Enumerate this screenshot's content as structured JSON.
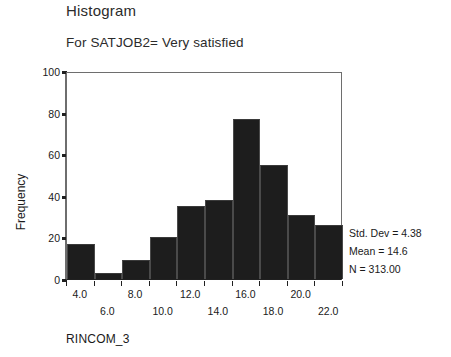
{
  "chart_data": {
    "type": "bar",
    "title": "Histogram",
    "subtitle": "For SATJOB2= Very satisfied",
    "xlabel": "RINCOM_3",
    "ylabel": "Frequency",
    "ylim": [
      0,
      100
    ],
    "xlim": [
      3,
      23
    ],
    "grid": false,
    "legend": null,
    "bin_width": 2,
    "bin_starts": [
      3,
      5,
      7,
      9,
      11,
      13,
      15,
      17,
      19,
      21
    ],
    "bin_centers": [
      4,
      6,
      8,
      10,
      12,
      14,
      16,
      18,
      20,
      22
    ],
    "categories": [
      "4.0",
      "6.0",
      "8.0",
      "10.0",
      "12.0",
      "14.0",
      "16.0",
      "18.0",
      "20.0",
      "22.0"
    ],
    "values": [
      17,
      3,
      9,
      20,
      35,
      38,
      77,
      55,
      31,
      26
    ],
    "y_ticks": [
      0,
      20,
      40,
      60,
      80,
      100
    ],
    "y_tick_labels": [
      "0",
      "20",
      "40",
      "60",
      "80",
      "100"
    ],
    "x_ticks": [
      3,
      5,
      7,
      9,
      11,
      13,
      15,
      17,
      19,
      21,
      23
    ],
    "x_tick_labels_top": [
      "4.0",
      "8.0",
      "12.0",
      "16.0",
      "20.0"
    ],
    "x_tick_labels_top_values": [
      4,
      8,
      12,
      16,
      20
    ],
    "x_tick_labels_bottom": [
      "6.0",
      "10.0",
      "14.0",
      "18.0",
      "22.0"
    ],
    "x_tick_labels_bottom_values": [
      6,
      10,
      14,
      18,
      22
    ],
    "bar_color": "#1d1d1d",
    "annotations": [
      "Std. Dev = 4.38",
      "Mean = 14.6",
      "N = 313.00"
    ]
  },
  "stats": {
    "std_dev": "Std. Dev = 4.38",
    "mean": "Mean = 14.6",
    "n": "N = 313.00"
  }
}
